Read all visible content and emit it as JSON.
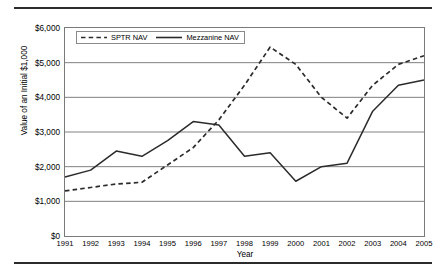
{
  "chart_data": {
    "type": "line",
    "title": "",
    "xlabel": "Year",
    "ylabel": "Value of an Initial $1,000",
    "categories": [
      "1991",
      "1992",
      "1993",
      "1994",
      "1995",
      "1996",
      "1997",
      "1998",
      "1999",
      "2000",
      "2001",
      "2002",
      "2003",
      "2004",
      "2005"
    ],
    "x": [
      1991,
      1992,
      1993,
      1994,
      1995,
      1996,
      1997,
      1998,
      1999,
      2000,
      2001,
      2002,
      2003,
      2004,
      2005
    ],
    "ylim": [
      0,
      6000
    ],
    "xlim": [
      1991,
      2005
    ],
    "ytick_labels": [
      "$0",
      "$1,000",
      "$2,000",
      "$3,000",
      "$4,000",
      "$5,000",
      "$6,000"
    ],
    "ytick_values": [
      0,
      1000,
      2000,
      3000,
      4000,
      5000,
      6000
    ],
    "grid": "horizontal",
    "legend_position": "top-left inside plot",
    "series": [
      {
        "name": "SPTR NAV",
        "style": "dashed",
        "color": "#2b2b2b",
        "values": [
          1300,
          1400,
          1500,
          1550,
          2050,
          2550,
          3350,
          4350,
          5450,
          4950,
          4000,
          3400,
          4350,
          4950,
          5200
        ]
      },
      {
        "name": "Mezzanine NAV",
        "style": "solid",
        "color": "#2b2b2b",
        "values": [
          1700,
          1900,
          2450,
          2300,
          2750,
          3300,
          3200,
          2300,
          2400,
          1580,
          2000,
          2100,
          3600,
          4350,
          4500
        ]
      }
    ]
  },
  "legend": {
    "entries": [
      {
        "label": "SPTR NAV"
      },
      {
        "label": "Mezzanine NAV"
      }
    ]
  },
  "colors": {
    "line": "#2b2b2b",
    "grid": "#808080",
    "frame": "#7a7a7a",
    "rule": "#2b2b2b"
  }
}
